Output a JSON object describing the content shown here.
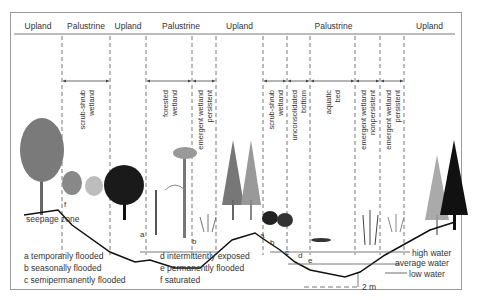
{
  "diagram": {
    "type": "wetland-cross-section",
    "systems": [
      {
        "label": "Upland",
        "x1": 14,
        "x2": 62
      },
      {
        "label": "Palustrine",
        "x1": 62,
        "x2": 110
      },
      {
        "label": "Upland",
        "x1": 110,
        "x2": 146
      },
      {
        "label": "Palustrine",
        "x1": 146,
        "x2": 216
      },
      {
        "label": "Upland",
        "x1": 216,
        "x2": 263
      },
      {
        "label": "Palustrine",
        "x1": 263,
        "x2": 404
      },
      {
        "label": "Upland",
        "x1": 404,
        "x2": 455
      }
    ],
    "classes": [
      {
        "lines": [
          "scrub-shrub",
          "wetland"
        ],
        "x1": 62,
        "x2": 110
      },
      {
        "lines": [
          "forested",
          "wetland"
        ],
        "x1": 146,
        "x2": 192
      },
      {
        "lines": [
          "emergent wetland",
          "persistent"
        ],
        "x1": 192,
        "x2": 216
      },
      {
        "lines": [
          "scrub-shrub",
          "wetland"
        ],
        "x1": 263,
        "x2": 287
      },
      {
        "lines": [
          "unconsolidated",
          "bottom"
        ],
        "x1": 287,
        "x2": 310
      },
      {
        "lines": [
          "aquatic",
          "bed"
        ],
        "x1": 310,
        "x2": 355
      },
      {
        "lines": [
          "emergent wetland",
          "nonpersistent"
        ],
        "x1": 355,
        "x2": 380
      },
      {
        "lines": [
          "emergent wetland",
          "persistent"
        ],
        "x1": 380,
        "x2": 404
      }
    ],
    "annotations": {
      "seepage_zone": "seepage zone",
      "high_water": "high water",
      "average_water": "average water",
      "low_water": "low water",
      "depth": "2 m"
    },
    "regime_letters": {
      "a": "a",
      "b": "b",
      "c": "c",
      "d": "d",
      "e": "e",
      "f": "f"
    },
    "legend": [
      {
        "key": "a",
        "text": "temporarily flooded"
      },
      {
        "key": "b",
        "text": "seasonally flooded"
      },
      {
        "key": "c",
        "text": "semipermanently flooded"
      },
      {
        "key": "d",
        "text": "intermittently exposed"
      },
      {
        "key": "e",
        "text": "permanently flooded"
      },
      {
        "key": "f",
        "text": "saturated"
      }
    ]
  }
}
